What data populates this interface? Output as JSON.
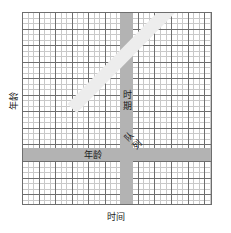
{
  "figure": {
    "type": "lexis-diagram",
    "width": 231,
    "height": 233,
    "background_color": "#ffffff"
  },
  "axes": {
    "y_label": "年龄",
    "x_label": "时间",
    "grid": {
      "minor_color": "#c9c9c9",
      "major_color": "#6e6e6e",
      "minor_spacing_px": 5.52,
      "major_spacing_px": 16.56,
      "minor_columns": 35,
      "minor_rows": 35,
      "major_columns": 12,
      "major_rows": 12
    }
  },
  "bands": [
    {
      "id": "period",
      "label": "时期",
      "orientation": "vertical",
      "color": "#b3b3b3",
      "thickness_px": 13
    },
    {
      "id": "age",
      "label": "年龄",
      "orientation": "horizontal",
      "color": "#b3b3b3",
      "thickness_px": 13
    },
    {
      "id": "cohort",
      "label": "队列",
      "orientation": "diagonal",
      "angle_deg": -45.5,
      "color": "#ededed",
      "thickness_px": 13
    }
  ],
  "chart_data": {
    "type": "scatter",
    "title": "",
    "xlabel": "时间",
    "ylabel": "年龄",
    "legend": [
      "时期",
      "年龄",
      "队列"
    ],
    "annotations": [
      "时期",
      "年龄",
      "队列"
    ],
    "grid": true,
    "series": [
      {
        "name": "时期",
        "orientation": "vertical",
        "value_px": 104
      },
      {
        "name": "年龄",
        "orientation": "horizontal",
        "value_px": 142
      },
      {
        "name": "队列",
        "orientation": "diagonal",
        "slope": 1
      }
    ]
  }
}
